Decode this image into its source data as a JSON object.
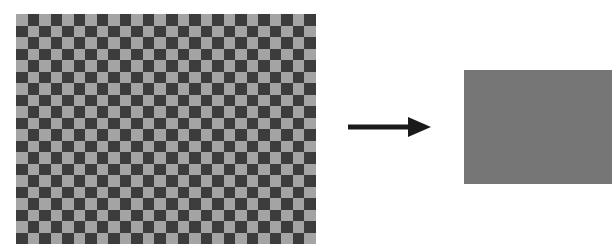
{
  "diagram": {
    "checkerboard": {
      "columns": 26,
      "rows": 20,
      "light_color": "#a4a4a4",
      "dark_color": "#3c3c3c",
      "top_left_cell": "light"
    },
    "arrow": {
      "direction": "right",
      "color": "#1a1a1a"
    },
    "result": {
      "shape": "rectangle",
      "fill_color": "#767676"
    }
  }
}
